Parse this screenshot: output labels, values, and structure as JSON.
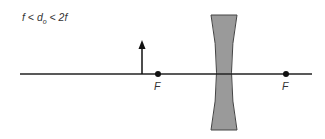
{
  "diagram": {
    "condition": {
      "f1": "f",
      "lt1": " < ",
      "d": "d",
      "sub": "o",
      "lt2": " < ",
      "rhs": "2f"
    },
    "focal_labels": [
      "F",
      "F"
    ],
    "elements": {
      "optical_axis": "horizontal line",
      "object": "upward arrow between F and 2F",
      "lens": "diverging (concave) lens",
      "focal_points": 2
    },
    "colors": {
      "line": "#222222",
      "lens_fill": "#9a9a9a",
      "lens_stroke": "#444444"
    }
  }
}
